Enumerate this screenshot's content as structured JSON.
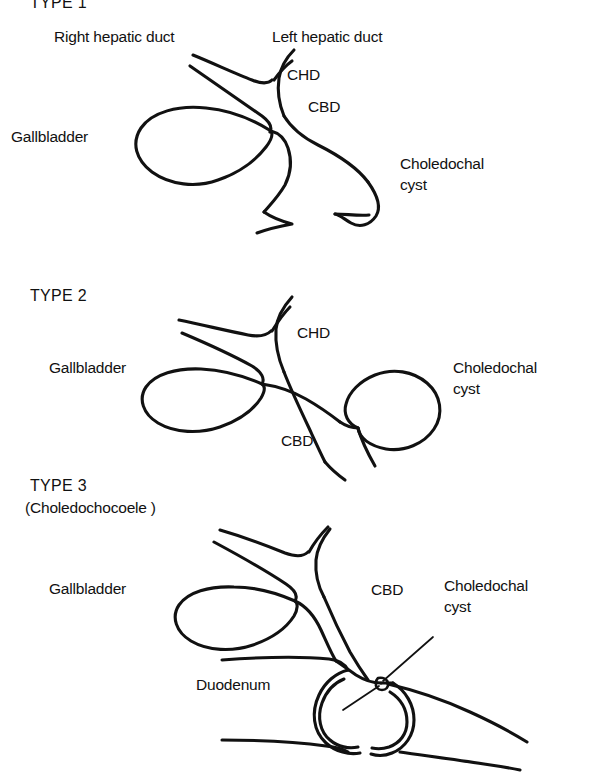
{
  "figure": {
    "background_color": "#ffffff",
    "ink_color": "#111111",
    "width": 594,
    "height": 774
  },
  "panels": [
    {
      "id": "type-1",
      "heading": "TYPE 1",
      "subheading": "",
      "labels": [
        {
          "name": "right-hepatic-duct-label",
          "text": "Right hepatic duct",
          "x": 54,
          "y": 30
        },
        {
          "name": "left-hepatic-duct-label",
          "text": "Left hepatic duct",
          "x": 272,
          "y": 30
        },
        {
          "name": "chd-label",
          "text": "CHD",
          "x": 287,
          "y": 69
        },
        {
          "name": "cbd-label",
          "text": "CBD",
          "x": 307,
          "y": 101
        },
        {
          "name": "gallbladder-label",
          "text": "Gallbladder",
          "x": 11,
          "y": 131
        },
        {
          "name": "choledochal-cyst-label",
          "text": "Choledochal",
          "x": 400,
          "y": 157
        },
        {
          "name": "choledochal-cyst-label-2",
          "text": "cyst",
          "x": 400,
          "y": 177
        }
      ]
    },
    {
      "id": "type-2",
      "heading": "TYPE 2",
      "subheading": "",
      "labels": [
        {
          "name": "type-2-heading",
          "text": "TYPE 2",
          "x": 30,
          "y": 292
        },
        {
          "name": "chd-label",
          "text": "CHD",
          "x": 297,
          "y": 327
        },
        {
          "name": "gallbladder-label",
          "text": "Gallbladder",
          "x": 49,
          "y": 362
        },
        {
          "name": "choledochal-cyst-label",
          "text": "Choledochal",
          "x": 453,
          "y": 362
        },
        {
          "name": "choledochal-cyst-label-2",
          "text": "cyst",
          "x": 453,
          "y": 382
        },
        {
          "name": "cbd-label",
          "text": "CBD",
          "x": 281,
          "y": 435
        }
      ]
    },
    {
      "id": "type-3",
      "heading": "TYPE 3",
      "subheading": "(Choledochocoele )",
      "labels": [
        {
          "name": "type-3-heading",
          "text": "TYPE 3",
          "x": 30,
          "y": 481
        },
        {
          "name": "type-3-subheading",
          "text": "(Choledochocoele )",
          "x": 25,
          "y": 503
        },
        {
          "name": "gallbladder-label",
          "text": "Gallbladder",
          "x": 49,
          "y": 583
        },
        {
          "name": "cbd-label",
          "text": "CBD",
          "x": 371,
          "y": 584
        },
        {
          "name": "choledochal-cyst-label",
          "text": "Choledochal",
          "x": 444,
          "y": 580
        },
        {
          "name": "choledochal-cyst-label-2",
          "text": "cyst",
          "x": 444,
          "y": 600
        },
        {
          "name": "duodenum-label",
          "text": "Duodenum",
          "x": 196,
          "y": 679
        }
      ]
    }
  ],
  "anatomy_terms": {
    "chd": "CHD",
    "cbd": "CBD",
    "gallbladder": "Gallbladder",
    "duodenum": "Duodenum",
    "right_hepatic_duct": "Right hepatic duct",
    "left_hepatic_duct": "Left hepatic duct",
    "choledochal_cyst_line1": "Choledochal",
    "choledochal_cyst_line2": "cyst",
    "type1": "TYPE 1",
    "type2": "TYPE 2",
    "type3": "TYPE 3",
    "choledochocoele": "(Choledochocoele )"
  }
}
